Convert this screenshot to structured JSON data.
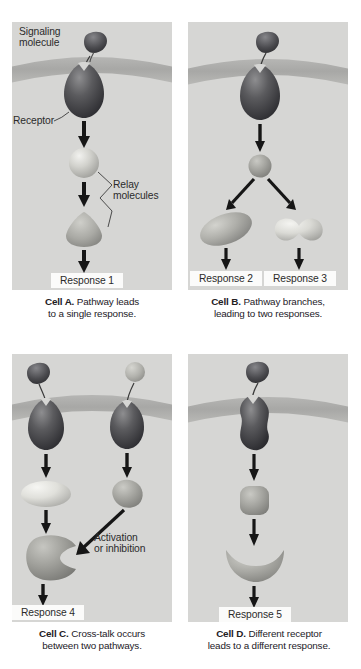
{
  "figure": {
    "title_visible": false,
    "background_color": "#ffffff",
    "panel_background": "#d6d6d4",
    "membrane_color": "#a8a8a6",
    "arrow_color": "#1a1a1a",
    "response_box_color": "#fbfbfa"
  },
  "panels": [
    {
      "id": "cell-a",
      "letter": "Cell A.",
      "caption_rest": " Pathway leads",
      "caption_line2": "to a single response.",
      "annotations": [
        {
          "name": "signaling-molecule-label",
          "text": "Signaling\nmolecule"
        },
        {
          "name": "receptor-label",
          "text": "Receptor"
        },
        {
          "name": "relay-molecules-label",
          "text": "Relay\nmolecules"
        }
      ],
      "shapes": [
        {
          "name": "signaling-molecule",
          "kind": "ligand-teardrop",
          "shade": "dark"
        },
        {
          "name": "receptor",
          "kind": "receptor-egg",
          "shade": "dark"
        },
        {
          "name": "relay-molecule-1",
          "kind": "sphere",
          "shade": "light"
        },
        {
          "name": "relay-molecule-2",
          "kind": "cone",
          "shade": "mid"
        }
      ],
      "responses": [
        {
          "name": "response-1",
          "label": "Response 1"
        }
      ]
    },
    {
      "id": "cell-b",
      "letter": "Cell B.",
      "caption_rest": " Pathway branches,",
      "caption_line2": "leading to two responses.",
      "annotations": [],
      "shapes": [
        {
          "name": "signaling-molecule",
          "kind": "ligand-teardrop",
          "shade": "dark"
        },
        {
          "name": "receptor",
          "kind": "receptor-egg",
          "shade": "dark"
        },
        {
          "name": "relay-molecule-1",
          "kind": "small-sphere",
          "shade": "mid"
        },
        {
          "name": "relay-molecule-left",
          "kind": "tilted-oval",
          "shade": "mid"
        },
        {
          "name": "relay-molecule-right",
          "kind": "peanut",
          "shade": "light"
        }
      ],
      "responses": [
        {
          "name": "response-2",
          "label": "Response 2"
        },
        {
          "name": "response-3",
          "label": "Response 3"
        }
      ]
    },
    {
      "id": "cell-c",
      "letter": "Cell C.",
      "caption_rest": " Cross-talk occurs",
      "caption_line2": "between two pathways.",
      "annotations": [
        {
          "name": "crosstalk-label",
          "text": "Activation\nor inhibition"
        }
      ],
      "shapes": [
        {
          "name": "signaling-molecule-left",
          "kind": "ligand-teardrop",
          "shade": "dark"
        },
        {
          "name": "signaling-molecule-right",
          "kind": "ligand-circle",
          "shade": "light"
        },
        {
          "name": "receptor-left",
          "kind": "receptor-egg",
          "shade": "dark"
        },
        {
          "name": "receptor-right",
          "kind": "receptor-cup",
          "shade": "dark"
        },
        {
          "name": "relay-molecule-left",
          "kind": "oval",
          "shade": "light"
        },
        {
          "name": "relay-molecule-right",
          "kind": "blob",
          "shade": "mid"
        },
        {
          "name": "relay-molecule-target",
          "kind": "notched-blob",
          "shade": "mid"
        }
      ],
      "responses": [
        {
          "name": "response-4",
          "label": "Response 4"
        }
      ]
    },
    {
      "id": "cell-d",
      "letter": "Cell D.",
      "caption_rest": " Different receptor",
      "caption_line2": "leads to a different response.",
      "annotations": [],
      "shapes": [
        {
          "name": "signaling-molecule",
          "kind": "ligand-teardrop",
          "shade": "dark"
        },
        {
          "name": "receptor",
          "kind": "receptor-hourglass",
          "shade": "dark"
        },
        {
          "name": "relay-molecule-1",
          "kind": "rounded-square",
          "shade": "mid"
        },
        {
          "name": "relay-molecule-2",
          "kind": "crescent",
          "shade": "mid"
        }
      ],
      "responses": [
        {
          "name": "response-5",
          "label": "Response 5"
        }
      ]
    }
  ]
}
